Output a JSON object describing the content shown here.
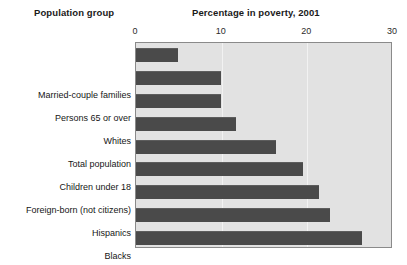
{
  "header": {
    "group_header": "Population group",
    "title": "Percentage in poverty, 2001"
  },
  "chart_data": {
    "type": "bar",
    "orientation": "horizontal",
    "title": "Percentage in poverty, 2001",
    "xlabel": "",
    "ylabel": "Population group",
    "xlim": [
      0,
      30
    ],
    "xticks": [
      0,
      10,
      20,
      30
    ],
    "xtick_labels": [
      "0",
      "10",
      "20",
      "30"
    ],
    "grid": true,
    "grid_axis": "x",
    "legend": false,
    "plot_background": "#e2e2e2",
    "bar_color": "#4a4a4a",
    "categories": [
      "Married-couple families",
      "Persons 65 or over",
      "Whites",
      "Total population",
      "Children under 18",
      "Foreign-born (not citizens)",
      "Hispanics",
      "Blacks",
      "Female householders"
    ],
    "values": [
      4.9,
      9.9,
      9.9,
      11.7,
      16.3,
      19.5,
      21.4,
      22.7,
      26.4
    ]
  }
}
